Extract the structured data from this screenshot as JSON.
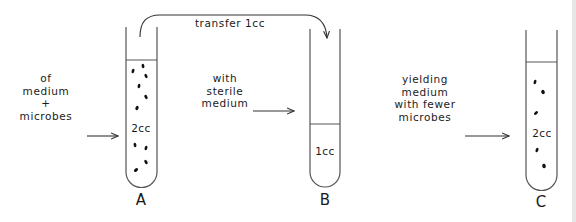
{
  "diagram": {
    "transfer_label": "transfer 1cc",
    "steps": [
      {
        "id": "step-1",
        "lines": [
          "of",
          "medium",
          "+",
          "microbes"
        ]
      },
      {
        "id": "step-2",
        "lines": [
          "with",
          "sterile",
          "medium"
        ]
      },
      {
        "id": "step-3",
        "lines": [
          "yielding",
          "medium",
          "with fewer",
          "microbes"
        ]
      }
    ],
    "tubes": [
      {
        "label": "A",
        "volume": "2cc",
        "microbe_count": 10,
        "contents": "medium + microbes"
      },
      {
        "label": "B",
        "volume": "1cc",
        "microbe_count": 0,
        "contents": "sterile medium"
      },
      {
        "label": "C",
        "volume": "2cc",
        "microbe_count": 5,
        "contents": "medium with fewer microbes"
      }
    ],
    "colors": {
      "ink": "#1a1a1a",
      "tube_outline": "#555555",
      "background": "#ffffff"
    }
  }
}
